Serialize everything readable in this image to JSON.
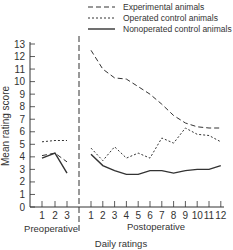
{
  "chart_data": {
    "type": "line",
    "title": "",
    "xlabel": "Daily ratings",
    "ylabel": "Mean rating score",
    "ylim": [
      0,
      13
    ],
    "yticks": [
      "0",
      "1",
      "2",
      "3",
      "4",
      "5",
      "6",
      "7",
      "8",
      "9",
      "10",
      "11",
      "12",
      "13"
    ],
    "grid": false,
    "legend_position": "top-right",
    "groups": [
      {
        "name": "Preoperative",
        "x": [
          "1",
          "2",
          "3"
        ]
      },
      {
        "name": "Postoperative",
        "x": [
          "1",
          "2",
          "3",
          "4",
          "5",
          "6",
          "7",
          "8",
          "9",
          "10",
          "11",
          "12"
        ]
      }
    ],
    "series": [
      {
        "name": "Experimental animals",
        "style": "long-dash",
        "preoperative": [
          4.1,
          4.3,
          3.6
        ],
        "postoperative": [
          12.5,
          11.0,
          10.3,
          10.2,
          9.6,
          9.0,
          8.2,
          7.3,
          6.7,
          6.4,
          6.3,
          6.3
        ]
      },
      {
        "name": "Operated control animals",
        "style": "short-dash",
        "preoperative": [
          5.2,
          5.3,
          5.3
        ],
        "postoperative": [
          4.7,
          3.7,
          4.8,
          3.9,
          4.3,
          3.9,
          5.5,
          5.1,
          6.3,
          5.8,
          5.7,
          5.2
        ]
      },
      {
        "name": "Nonoperated control animals",
        "style": "solid",
        "preoperative": [
          3.9,
          4.3,
          2.7
        ],
        "postoperative": [
          4.2,
          3.3,
          2.9,
          2.6,
          2.6,
          2.9,
          2.9,
          2.7,
          2.9,
          3.0,
          3.0,
          3.3
        ]
      }
    ]
  },
  "labels": {
    "ylabel": "Mean rating score",
    "xlabel": "Daily ratings",
    "pre_group": "Preoperative",
    "post_group": "Postoperative"
  },
  "legend": [
    {
      "label": "Experimental animals",
      "style": "long-dash"
    },
    {
      "label": "Operated control animals",
      "style": "short-dash"
    },
    {
      "label": "Nonoperated control animals",
      "style": "solid"
    }
  ],
  "colors": {
    "line": "#333333",
    "text": "#333333"
  }
}
